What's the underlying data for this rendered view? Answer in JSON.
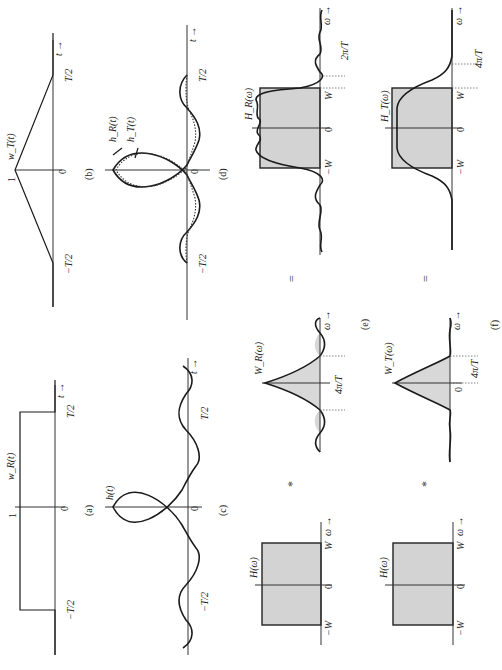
{
  "figure": {
    "orientation": "rotated 90deg counter-clockwise",
    "panels": {
      "a": {
        "label": "(a)",
        "func": "w_R(t)",
        "amp": "1",
        "origin": "0",
        "pos_tick": "T/2",
        "neg_tick": "−T/2",
        "axis": "t →"
      },
      "b": {
        "label": "(b)",
        "func": "w_T(t)",
        "amp": "1",
        "origin": "0",
        "pos_tick": "T/2",
        "neg_tick": "−T/2",
        "axis": "t →"
      },
      "c": {
        "label": "(c)",
        "func": "h(t)",
        "origin": "0",
        "pos_tick": "T/2",
        "neg_tick": "−T/2",
        "axis": "t →"
      },
      "d": {
        "label": "(d)",
        "func1": "h_R(t)",
        "func2": "h_T(t)",
        "origin": "0",
        "pos_tick": "T/2",
        "neg_tick": "−T/2",
        "axis": "t →"
      },
      "e": {
        "label": "(e)",
        "lhs": {
          "func": "H(ω)",
          "origin": "0",
          "pos_tick": "W",
          "neg_tick": "−W",
          "axis": "ω →"
        },
        "op1": "*",
        "window": {
          "func": "W_R(ω)",
          "width": "4π/T",
          "axis": "ω →"
        },
        "op2": "=",
        "result": {
          "func": "H_R(ω)",
          "origin": "0",
          "pos_tick": "W",
          "neg_tick": "−W",
          "width": "2π/T",
          "axis": "ω →"
        }
      },
      "f": {
        "label": "(f)",
        "lhs": {
          "func": "H(ω)",
          "origin": "0",
          "pos_tick": "W",
          "neg_tick": "−W",
          "axis": "ω →"
        },
        "op1": "*",
        "window": {
          "func": "W_T(ω)",
          "origin": "0",
          "width": "4π/T",
          "axis": "ω →"
        },
        "op2": "=",
        "result": {
          "func": "H_T(ω)",
          "origin": "0",
          "pos_tick": "W",
          "neg_tick": "−W",
          "width": "4π/T",
          "axis": "ω →"
        }
      }
    }
  }
}
